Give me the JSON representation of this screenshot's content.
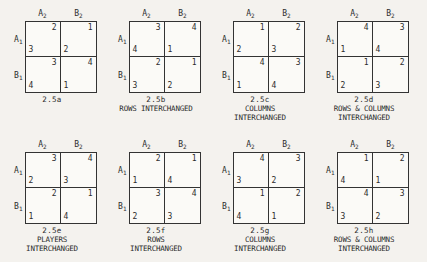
{
  "figure": {
    "cell_note": "each cell shows column-player payoff upper-right and row-player payoff lower-left",
    "row_labels": [
      "A",
      "B"
    ],
    "row_label_subscript": "1",
    "col_labels": [
      "A",
      "B"
    ],
    "col_label_subscript": "2",
    "matrices": [
      {
        "id": "2.5a",
        "description_lines": [],
        "cells": [
          {
            "col": 2,
            "row": 3
          },
          {
            "col": 1,
            "row": 2
          },
          {
            "col": 3,
            "row": 4
          },
          {
            "col": 4,
            "row": 1
          }
        ]
      },
      {
        "id": "2.5b",
        "description_lines": [
          "ROWS INTERCHANGED"
        ],
        "cells": [
          {
            "col": 3,
            "row": 4
          },
          {
            "col": 4,
            "row": 1
          },
          {
            "col": 2,
            "row": 3
          },
          {
            "col": 1,
            "row": 2
          }
        ]
      },
      {
        "id": "2.5c",
        "description_lines": [
          "COLUMNS",
          "INTERCHANGED"
        ],
        "cells": [
          {
            "col": 1,
            "row": 2
          },
          {
            "col": 2,
            "row": 3
          },
          {
            "col": 4,
            "row": 1
          },
          {
            "col": 3,
            "row": 4
          }
        ]
      },
      {
        "id": "2.5d",
        "description_lines": [
          "ROWS & COLUMNS",
          "INTERCHANGED"
        ],
        "cells": [
          {
            "col": 4,
            "row": 1
          },
          {
            "col": 3,
            "row": 4
          },
          {
            "col": 1,
            "row": 2
          },
          {
            "col": 2,
            "row": 3
          }
        ]
      },
      {
        "id": "2.5e",
        "description_lines": [
          "PLAYERS",
          "INTERCHANGED"
        ],
        "cells": [
          {
            "col": 3,
            "row": 2
          },
          {
            "col": 4,
            "row": 3
          },
          {
            "col": 2,
            "row": 1
          },
          {
            "col": 1,
            "row": 4
          }
        ]
      },
      {
        "id": "2.5f",
        "description_lines": [
          "ROWS",
          "INTERCHANGED"
        ],
        "cells": [
          {
            "col": 2,
            "row": 1
          },
          {
            "col": 1,
            "row": 4
          },
          {
            "col": 3,
            "row": 2
          },
          {
            "col": 4,
            "row": 3
          }
        ]
      },
      {
        "id": "2.5g",
        "description_lines": [
          "COLUMNS",
          "INTERCHANGED"
        ],
        "cells": [
          {
            "col": 4,
            "row": 3
          },
          {
            "col": 3,
            "row": 2
          },
          {
            "col": 1,
            "row": 4
          },
          {
            "col": 2,
            "row": 1
          }
        ]
      },
      {
        "id": "2.5h",
        "description_lines": [
          "ROWS & COLUMNS",
          "INTERCHANGED"
        ],
        "cells": [
          {
            "col": 1,
            "row": 4
          },
          {
            "col": 2,
            "row": 1
          },
          {
            "col": 4,
            "row": 3
          },
          {
            "col": 3,
            "row": 2
          }
        ]
      }
    ]
  },
  "colors": {
    "paper": "#f4f2ee",
    "ink": "#2b2b2b",
    "rule": "#333333"
  }
}
